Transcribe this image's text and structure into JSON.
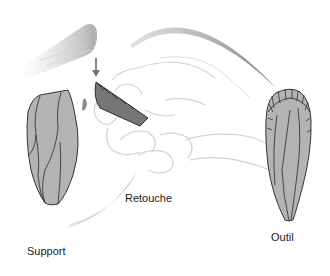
{
  "diagram": {
    "labels": {
      "support": "Support",
      "retouche": "Retouche",
      "outil": "Outil"
    },
    "elements": [
      {
        "name": "hammer",
        "description": "cylindrical soft hammer striking downward"
      },
      {
        "name": "strike-arrow",
        "description": "downward arrow indicating strike"
      },
      {
        "name": "hand",
        "description": "hand holding flake during retouch"
      },
      {
        "name": "flake-in-hand",
        "description": "dark flake being retouched"
      },
      {
        "name": "support-blank",
        "description": "unretouched blade blank"
      },
      {
        "name": "outil-tool",
        "description": "finished retouched tool (endscraper)"
      },
      {
        "name": "flow-arc-top",
        "description": "arc from hand to finished tool"
      },
      {
        "name": "flow-arc-bottom",
        "description": "arc from support to hand"
      }
    ],
    "colors": {
      "stone_fill": "#b4b4b4",
      "stone_outline": "#333333",
      "flake_dark": "#6e6e6e",
      "sketch_line": "#cfcfcf",
      "arc_gray": "#9a9a9a",
      "text": "#1a1a1a"
    }
  }
}
